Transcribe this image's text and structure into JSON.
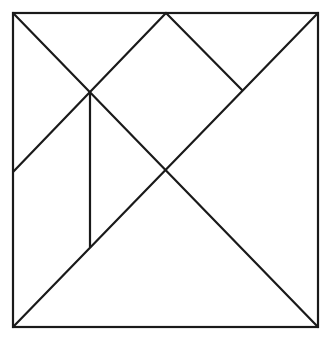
{
  "diagram": {
    "type": "tangram-square",
    "stroke_color": "#1a1a1a",
    "background": "#ffffff",
    "outer_square": {
      "x": 13,
      "y": 13,
      "width": 305,
      "height": 314
    },
    "points": {
      "top_left": [
        13,
        13
      ],
      "top_mid": [
        166,
        13
      ],
      "top_right": [
        318,
        13
      ],
      "bottom_left": [
        13,
        327
      ],
      "bottom_right": [
        318,
        327
      ],
      "left_mid": [
        13,
        172
      ],
      "upper_cross": [
        90,
        93
      ],
      "center": [
        166,
        170
      ],
      "right_joint": [
        242,
        90
      ],
      "vert_bottom": [
        90,
        247
      ]
    },
    "segments": [
      {
        "name": "diagonal-topleft-to-bottomright",
        "from": [
          13,
          13
        ],
        "to": [
          318,
          327
        ]
      },
      {
        "name": "diagonal-bottomleft-to-topright",
        "from": [
          13,
          327
        ],
        "to": [
          318,
          13
        ]
      },
      {
        "name": "line-leftmid-to-topmid",
        "from": [
          13,
          172
        ],
        "to": [
          166,
          13
        ]
      },
      {
        "name": "line-topmid-to-rightjoint",
        "from": [
          166,
          13
        ],
        "to": [
          242,
          90
        ]
      },
      {
        "name": "vertical-line",
        "from": [
          90,
          93
        ],
        "to": [
          90,
          247
        ]
      }
    ],
    "pieces": [
      "large-triangle-bottom",
      "large-triangle-right",
      "medium-triangle-top-left",
      "small-triangle-top",
      "square-middle",
      "small-triangle-left",
      "parallelogram-left"
    ]
  }
}
